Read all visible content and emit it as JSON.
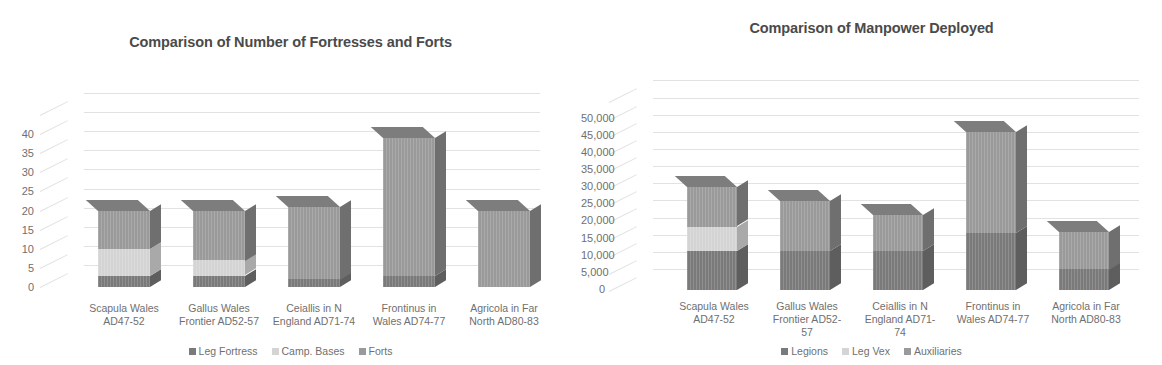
{
  "charts": [
    {
      "id": "fortresses",
      "title": "Comparison of Number of Fortresses and Forts",
      "legend": [
        {
          "label": "Leg Fortress",
          "color": "#7a7a7a"
        },
        {
          "label": "Camp. Bases",
          "color": "#d4d4d4"
        },
        {
          "label": "Forts",
          "color": "#9a9a9a"
        }
      ],
      "yticks": [
        "0",
        "5",
        "10",
        "15",
        "20",
        "25",
        "30",
        "35",
        "40"
      ],
      "categories": [
        [
          "Scapula Wales",
          "AD47-52"
        ],
        [
          "Gallus Wales",
          "Frontier AD52-57"
        ],
        [
          "Ceiallis in N",
          "England AD71-74"
        ],
        [
          "Frontinus in",
          "Wales AD74-77"
        ],
        [
          "Agricola in Far",
          "North AD80-83"
        ]
      ]
    },
    {
      "id": "manpower",
      "title": "Comparison of Manpower Deployed",
      "legend": [
        {
          "label": "Legions",
          "color": "#7a7a7a"
        },
        {
          "label": "Leg Vex",
          "color": "#d4d4d4"
        },
        {
          "label": "Auxiliaries",
          "color": "#9a9a9a"
        }
      ],
      "yticks": [
        "0",
        "5,000",
        "10,000",
        "15,000",
        "20,000",
        "25,000",
        "30,000",
        "35,000",
        "40,000",
        "45,000",
        "50,000"
      ],
      "categories": [
        [
          "Scapula Wales",
          "AD47-52"
        ],
        [
          "Gallus Wales",
          "Frontier AD52-",
          "57"
        ],
        [
          "Ceiallis in N",
          "England AD71-",
          "74"
        ],
        [
          "Frontinus in",
          "Wales AD74-77"
        ],
        [
          "Agricola in Far",
          "North AD80-83"
        ]
      ]
    }
  ],
  "chart_data": [
    {
      "type": "bar",
      "stacked": true,
      "title": "Comparison of Number of Fortresses and Forts",
      "xlabel": "",
      "ylabel": "",
      "ylim": [
        0,
        45
      ],
      "ytick_step": 5,
      "grid": true,
      "legend_position": "bottom",
      "categories": [
        "Scapula Wales AD47-52",
        "Gallus Wales Frontier AD52-57",
        "Ceiallis in N England AD71-74",
        "Frontinus in Wales AD74-77",
        "Agricola in Far North AD80-83"
      ],
      "series": [
        {
          "name": "Leg Fortress",
          "color": "#7a7a7a",
          "values": [
            3,
            3,
            2,
            3,
            0
          ]
        },
        {
          "name": "Camp. Bases",
          "color": "#d4d4d4",
          "values": [
            7,
            4,
            0,
            0,
            0
          ]
        },
        {
          "name": "Forts",
          "color": "#9a9a9a",
          "values": [
            10,
            13,
            19,
            36,
            20
          ]
        }
      ],
      "totals": [
        20,
        20,
        21,
        39,
        20
      ]
    },
    {
      "type": "bar",
      "stacked": true,
      "title": "Comparison of Manpower Deployed",
      "xlabel": "",
      "ylabel": "",
      "ylim": [
        0,
        55000
      ],
      "ytick_step": 5000,
      "grid": true,
      "legend_position": "bottom",
      "categories": [
        "Scapula Wales AD47-52",
        "Gallus Wales Frontier AD52-57",
        "Ceiallis in N England AD71-74",
        "Frontinus in Wales AD74-77",
        "Agricola in Far North AD80-83"
      ],
      "series": [
        {
          "name": "Legions",
          "color": "#7a7a7a",
          "values": [
            11500,
            11500,
            11500,
            16500,
            6000
          ]
        },
        {
          "name": "Leg Vex",
          "color": "#d4d4d4",
          "values": [
            7000,
            0,
            0,
            0,
            0
          ]
        },
        {
          "name": "Auxiliaries",
          "color": "#9a9a9a",
          "values": [
            11500,
            14500,
            10500,
            29500,
            11000
          ]
        }
      ],
      "totals": [
        30000,
        26000,
        22000,
        46000,
        17000
      ]
    }
  ]
}
